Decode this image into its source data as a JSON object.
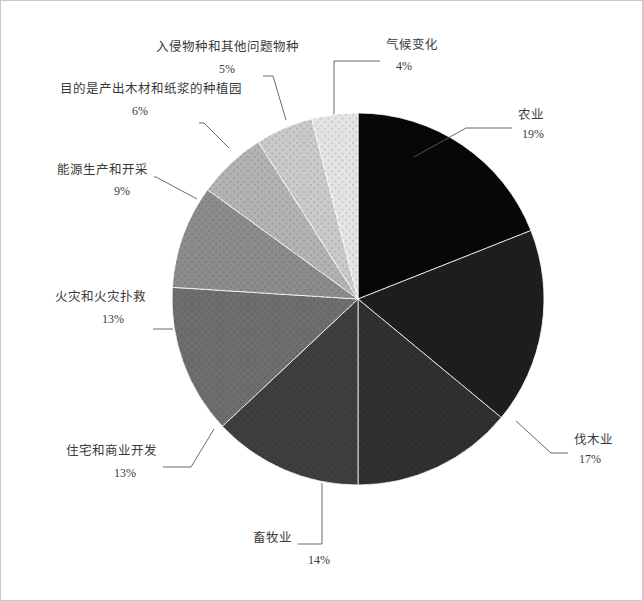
{
  "page": {
    "background_color": "#ffffff",
    "border_color": "#c9c9c9",
    "width": 643,
    "height": 601
  },
  "chart_data": {
    "type": "pie",
    "title": "",
    "subtitle": "",
    "xlabel": "",
    "ylabel": "",
    "legend_position": "none",
    "grid": false,
    "start_angle_deg": 0,
    "direction": "clockwise",
    "center": {
      "x": 357,
      "y": 298
    },
    "radius": 186,
    "labels": [
      "农业",
      "伐木业",
      "畜牧业",
      "住宅和商业开发",
      "火灾和火灾扑救",
      "能源生产和开采",
      "目的是产出木材和纸浆的种植园",
      "入侵物种和其他问题物种",
      "气候变化"
    ],
    "values": [
      19,
      17,
      14,
      13,
      13,
      9,
      6,
      5,
      4
    ],
    "value_labels": [
      "19%",
      "17%",
      "14%",
      "13%",
      "13%",
      "9%",
      "6%",
      "5%",
      "4%"
    ],
    "colors": [
      "#070707",
      "#1e1e1e",
      "#303030",
      "#3e3e3e",
      "#6e6e6e",
      "#8c8c8c",
      "#b3b3b3",
      "#cacaca",
      "#e4e4e4"
    ],
    "slices": [
      {
        "name": "agriculture",
        "label": "农业",
        "value": 19,
        "value_label": "19%",
        "color": "#070707",
        "text_anchor": "start",
        "text_x": 517,
        "text_y": 118,
        "pct_x": 521,
        "pct_y": 137,
        "leader": "M 413,156 L 465,127 L 511,127"
      },
      {
        "name": "logging",
        "label": "伐木业",
        "value": 17,
        "value_label": "17%",
        "color": "#1e1e1e",
        "text_anchor": "start",
        "text_x": 573,
        "text_y": 443,
        "pct_x": 578,
        "pct_y": 462,
        "leader": "M 515,420 L 550,452 L 567,452"
      },
      {
        "name": "livestock",
        "label": "畜牧业",
        "value": 14,
        "value_label": "14%",
        "color": "#303030",
        "text_anchor": "end",
        "text_x": 291,
        "text_y": 541,
        "pct_x": 307,
        "pct_y": 563,
        "leader": "M 321,482 L 321,543 L 297,543"
      },
      {
        "name": "residential-commercial-development",
        "label": "住宅和商业开发",
        "value": 13,
        "value_label": "13%",
        "color": "#3e3e3e",
        "text_anchor": "end",
        "text_x": 156,
        "text_y": 454,
        "pct_x": 113,
        "pct_y": 476,
        "leader": "M 213,428 L 190,466 L 162,466"
      },
      {
        "name": "fire-and-fire-suppression",
        "label": "火灾和火灾扑救",
        "value": 13,
        "value_label": "13%",
        "color": "#6e6e6e",
        "text_anchor": "end",
        "text_x": 145,
        "text_y": 300,
        "pct_x": 101,
        "pct_y": 322,
        "leader": "M 172,328 L 152,328"
      },
      {
        "name": "energy-production-and-mining",
        "label": "能源生产和开采",
        "value": 9,
        "value_label": "9%",
        "color": "#8c8c8c",
        "text_anchor": "end",
        "text_x": 147,
        "text_y": 173,
        "pct_x": 113,
        "pct_y": 194,
        "leader": "M 196,198 L 155,176 L 153,176"
      },
      {
        "name": "plantations-for-wood-and-pulp",
        "label": "目的是产出木材和纸浆的种植园",
        "value": 6,
        "value_label": "6%",
        "color": "#b3b3b3",
        "text_anchor": "end",
        "text_x": 241,
        "text_y": 92,
        "pct_x": 131,
        "pct_y": 114,
        "leader": "M 228,147 L 203,122 L 198,122"
      },
      {
        "name": "invasive-and-problematic-species",
        "label": "入侵物种和其他问题物种",
        "value": 5,
        "value_label": "5%",
        "color": "#cacaca",
        "text_anchor": "end",
        "text_x": 298,
        "text_y": 50,
        "pct_x": 218,
        "pct_y": 72,
        "leader": "M 285,119 L 272,75 L 262,75"
      },
      {
        "name": "climate-change",
        "label": "气候变化",
        "value": 4,
        "value_label": "4%",
        "color": "#e4e4e4",
        "text_anchor": "start",
        "text_x": 385,
        "text_y": 48,
        "pct_x": 395,
        "pct_y": 69,
        "leader": "M 333,113 L 333,60 L 379,60"
      }
    ]
  }
}
